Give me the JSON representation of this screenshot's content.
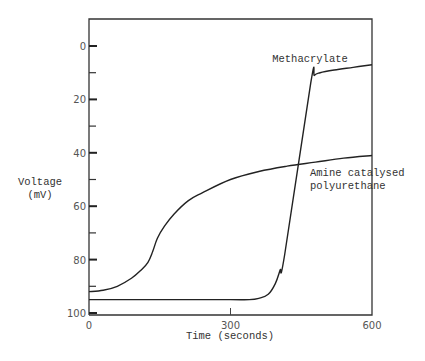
{
  "chart_data": {
    "type": "line",
    "title": "",
    "xlabel": "Time (seconds)",
    "ylabel": "Voltage (mV)",
    "ylabel_lines": [
      "Voltage",
      "(mV)"
    ],
    "xlim": [
      0,
      600
    ],
    "ylim": [
      100,
      0
    ],
    "y_inverted": true,
    "grid": false,
    "legend": "inline annotations",
    "x_ticks": [
      0,
      300,
      600
    ],
    "x_tick_labels": [
      "0",
      "300",
      "600"
    ],
    "y_major_ticks": [
      0,
      20,
      40,
      60,
      80,
      100
    ],
    "y_tick_labels": [
      "0",
      "20",
      "40",
      "60",
      "80",
      "100"
    ],
    "y_minor_ticks": [
      10,
      30,
      50,
      70,
      90
    ],
    "series": [
      {
        "name": "Methacrylate",
        "label": "Methacrylate",
        "x": [
          0,
          100,
          200,
          300,
          340,
          360,
          380,
          395,
          405,
          415,
          470,
          478,
          490,
          520,
          560,
          600
        ],
        "y": [
          95,
          95,
          95,
          95,
          95,
          94.5,
          93,
          89,
          84,
          78,
          14,
          11,
          10,
          9,
          8,
          7
        ]
      },
      {
        "name": "Amine catalysed polyurethane",
        "label_lines": [
          "Amine catalysed",
          "polyurethane"
        ],
        "x": [
          0,
          30,
          60,
          90,
          110,
          125,
          135,
          145,
          160,
          180,
          210,
          240,
          300,
          360,
          420,
          480,
          540,
          600
        ],
        "y": [
          92,
          91.5,
          90,
          87,
          84,
          81,
          77,
          72,
          67.5,
          63,
          58,
          55,
          50,
          47,
          45,
          43.5,
          42,
          41
        ]
      }
    ]
  }
}
